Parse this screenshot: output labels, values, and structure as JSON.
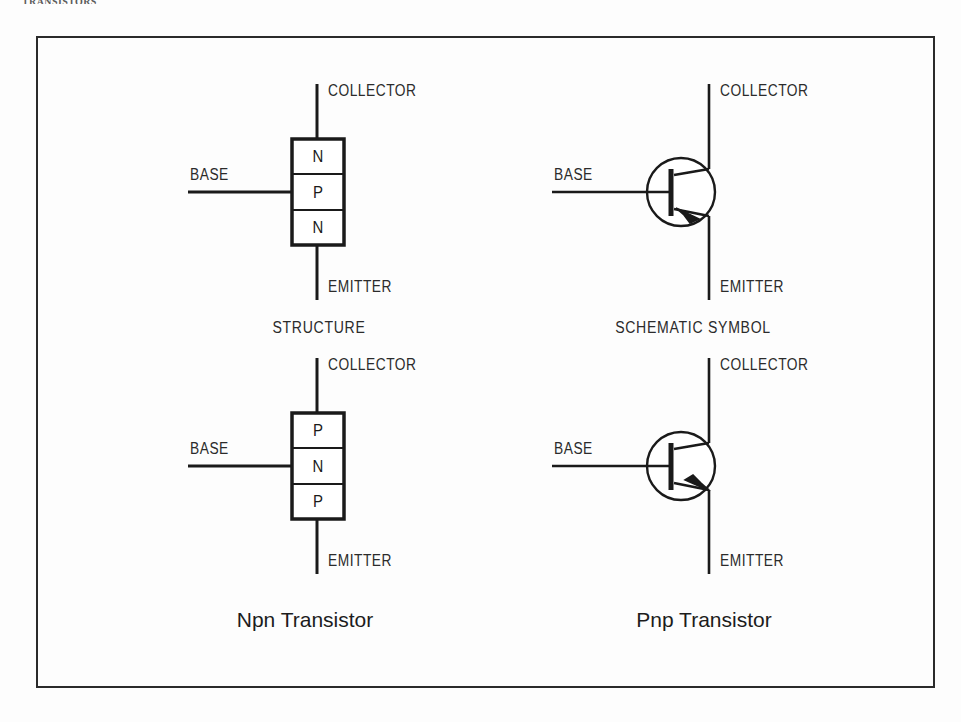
{
  "page": {
    "header_text": "TRANSISTORS",
    "background_color": "#fdfdfd",
    "frame_color": "#2b2b2b",
    "ink_color": "#1a1a1a"
  },
  "figure": {
    "column_labels": {
      "structure": "STRUCTURE",
      "schematic_symbol": "SCHEMATIC SYMBOL"
    },
    "captions": {
      "npn": "Npn Transistor",
      "pnp": "Pnp Transistor"
    },
    "terminals": {
      "collector": "COLLECTOR",
      "base": "BASE",
      "emitter": "EMITTER"
    },
    "npn_structure": {
      "layers": [
        "N",
        "P",
        "N"
      ],
      "base_contact_layer": "P",
      "collector_layer": "N",
      "emitter_layer": "N"
    },
    "pnp_structure": {
      "layers": [
        "P",
        "N",
        "P"
      ],
      "base_contact_layer": "N",
      "collector_layer": "P",
      "emitter_layer": "P"
    },
    "npn_symbol": {
      "arrow_direction": "inward",
      "arrow_on": "emitter"
    },
    "pnp_symbol": {
      "arrow_direction": "outward",
      "arrow_on": "emitter"
    }
  }
}
